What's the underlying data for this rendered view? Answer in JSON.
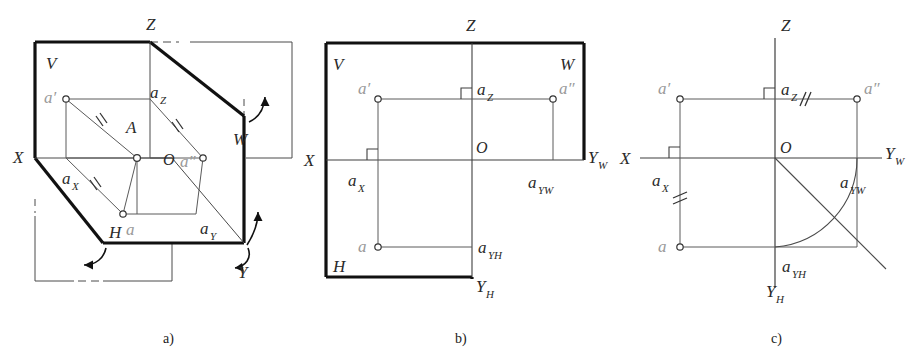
{
  "figure": {
    "background_color": "#ffffff",
    "line_color": "#333333",
    "thick_line_color": "#111111",
    "light_label_color": "#9a9a9a",
    "panel_captions": [
      {
        "id": "a",
        "text": "a)",
        "x": 170,
        "y": 338
      },
      {
        "id": "b",
        "text": "b)",
        "x": 462,
        "y": 338
      },
      {
        "id": "c",
        "text": "c)",
        "x": 778,
        "y": 338
      }
    ]
  },
  "panel_a": {
    "caption": "a)",
    "description": "Pictorial view of the three mutually perpendicular projection planes V, H, W with point A and its projections a', a, a''",
    "plane_labels": [
      {
        "name": "V",
        "text": "V",
        "x": 46,
        "y": 63
      },
      {
        "name": "W",
        "text": "W",
        "x": 233,
        "y": 139
      },
      {
        "name": "H",
        "text": "H",
        "x": 113,
        "y": 232
      }
    ],
    "axis_labels": [
      {
        "name": "Z",
        "text": "Z",
        "x": 150,
        "y": 24
      },
      {
        "name": "X",
        "text": "X",
        "x": 17,
        "y": 155
      },
      {
        "name": "Y",
        "text": "Y",
        "x": 241,
        "y": 272
      }
    ],
    "point_labels": [
      {
        "name": "a-prime",
        "text": "a′",
        "x": 53,
        "y": 96,
        "style": "light"
      },
      {
        "name": "A",
        "text": "A",
        "x": 130,
        "y": 128,
        "style": "dark"
      },
      {
        "name": "a-double-prime",
        "text": "a″",
        "x": 185,
        "y": 161,
        "style": "light"
      },
      {
        "name": "a",
        "text": "a",
        "x": 126,
        "y": 231,
        "style": "light"
      },
      {
        "name": "O",
        "text": "O",
        "x": 170,
        "y": 158,
        "style": "dark"
      },
      {
        "name": "a-sub-Z",
        "text": "a",
        "sub": "Z",
        "x": 153,
        "y": 92
      },
      {
        "name": "a-sub-X",
        "text": "a",
        "sub": "X",
        "x": 66,
        "y": 178
      },
      {
        "name": "a-sub-Y",
        "text": "a",
        "sub": "Y",
        "x": 204,
        "y": 228
      }
    ],
    "tick_marks": 3,
    "rotation_arrows": 3
  },
  "panel_b": {
    "caption": "b)",
    "description": "Unfolded (developed) projection planes showing the three-view layout",
    "plane_labels": [
      {
        "name": "V",
        "text": "V",
        "x": 333,
        "y": 64
      },
      {
        "name": "W",
        "text": "W",
        "x": 566,
        "y": 64
      },
      {
        "name": "H",
        "text": "H",
        "x": 333,
        "y": 272
      }
    ],
    "axis_labels": [
      {
        "name": "Z",
        "text": "Z",
        "x": 466,
        "y": 25
      },
      {
        "name": "X",
        "text": "X",
        "x": 308,
        "y": 163
      },
      {
        "name": "Y-sub-W",
        "text": "Y",
        "sub": "W",
        "x": 591,
        "y": 162
      },
      {
        "name": "Y-sub-H",
        "text": "Y",
        "sub": "H",
        "x": 474,
        "y": 289
      }
    ],
    "point_labels": [
      {
        "name": "a-prime",
        "text": "a′",
        "x": 362,
        "y": 96,
        "style": "light"
      },
      {
        "name": "a-double-prime",
        "text": "a″",
        "x": 562,
        "y": 96,
        "style": "light"
      },
      {
        "name": "a",
        "text": "a",
        "x": 362,
        "y": 249,
        "style": "light"
      },
      {
        "name": "O",
        "text": "O",
        "x": 478,
        "y": 148,
        "style": "dark"
      },
      {
        "name": "a-sub-Z",
        "text": "a",
        "sub": "Z",
        "x": 481,
        "y": 90
      },
      {
        "name": "a-sub-X",
        "text": "a",
        "sub": "X",
        "x": 352,
        "y": 182
      },
      {
        "name": "a-sub-YW",
        "text": "a",
        "sub": "YW",
        "x": 534,
        "y": 184
      },
      {
        "name": "a-sub-YH",
        "text": "a",
        "sub": "YH",
        "x": 482,
        "y": 249
      }
    ],
    "right_angle_markers": 2
  },
  "panel_c": {
    "caption": "c)",
    "description": "Final two-dimensional projection drawing with 45-degree auxiliary line and quarter arc linking the two Y axes",
    "axis_labels": [
      {
        "name": "Z",
        "text": "Z",
        "x": 778,
        "y": 25
      },
      {
        "name": "X",
        "text": "X",
        "x": 626,
        "y": 163
      },
      {
        "name": "Y-sub-W",
        "text": "Y",
        "sub": "W",
        "x": 887,
        "y": 162
      },
      {
        "name": "Y-sub-H",
        "text": "Y",
        "sub": "H",
        "x": 772,
        "y": 296
      }
    ],
    "point_labels": [
      {
        "name": "a-prime",
        "text": "a′",
        "x": 663,
        "y": 96,
        "style": "light"
      },
      {
        "name": "a-double-prime",
        "text": "a″",
        "x": 868,
        "y": 96,
        "style": "light"
      },
      {
        "name": "a",
        "text": "a",
        "x": 663,
        "y": 249,
        "style": "light"
      },
      {
        "name": "O",
        "text": "O",
        "x": 782,
        "y": 148,
        "style": "dark"
      },
      {
        "name": "a-sub-Z",
        "text": "a",
        "sub": "Z",
        "x": 785,
        "y": 90
      },
      {
        "name": "a-sub-X",
        "text": "a",
        "sub": "X",
        "x": 656,
        "y": 182
      },
      {
        "name": "a-sub-YW",
        "text": "a",
        "sub": "YW",
        "x": 845,
        "y": 184
      },
      {
        "name": "a-sub-YH",
        "text": "a",
        "sub": "YH",
        "x": 786,
        "y": 268
      }
    ],
    "right_angle_markers": 2,
    "tick_marks": 2,
    "has_45_degree_line": true,
    "has_quarter_arc": true
  }
}
